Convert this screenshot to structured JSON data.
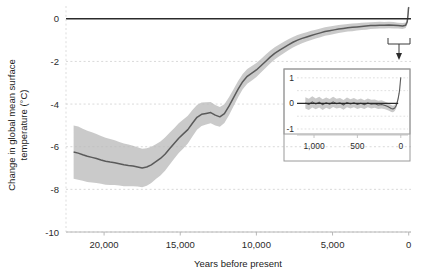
{
  "chart_data": {
    "type": "line",
    "title": "",
    "xlabel": "Years before present",
    "ylabel": "Change in global mean surface temperature (°C)",
    "xlim": [
      22500,
      -150
    ],
    "ylim": [
      -10,
      0.6
    ],
    "x_ticks": [
      20000,
      15000,
      10000,
      5000,
      0
    ],
    "x_tick_labels": [
      "20,000",
      "15,000",
      "10,000",
      "5,000",
      "0"
    ],
    "y_ticks": [
      0,
      -2,
      -4,
      -6,
      -8,
      -10
    ],
    "y_tick_labels": [
      "0",
      "-2",
      "-4",
      "-6",
      "-8",
      "-10"
    ],
    "grid": "horizontal-dashed",
    "legend": "none",
    "zero_reference_line": 0,
    "series": [
      {
        "name": "Global mean surface temperature anomaly",
        "color": "#5a5a5a",
        "band_color": "#b8b8b8",
        "x": [
          22000,
          21700,
          21400,
          21100,
          20800,
          20500,
          20200,
          19900,
          19600,
          19300,
          19000,
          18700,
          18400,
          18100,
          17800,
          17500,
          17200,
          16900,
          16600,
          16300,
          16000,
          15700,
          15400,
          15100,
          14800,
          14500,
          14200,
          13900,
          13600,
          13300,
          13000,
          12700,
          12400,
          12100,
          11800,
          11500,
          11200,
          10900,
          10600,
          10300,
          10000,
          9700,
          9400,
          9100,
          8800,
          8500,
          8200,
          7900,
          7600,
          7300,
          7000,
          6700,
          6400,
          6100,
          5800,
          5500,
          5200,
          4900,
          4600,
          4300,
          4000,
          3700,
          3400,
          3100,
          2800,
          2500,
          2200,
          1900,
          1600,
          1300,
          1000,
          700,
          400,
          200,
          100,
          50,
          20,
          0
        ],
        "y": [
          -6.25,
          -6.3,
          -6.38,
          -6.45,
          -6.5,
          -6.55,
          -6.62,
          -6.68,
          -6.72,
          -6.75,
          -6.8,
          -6.85,
          -6.88,
          -6.9,
          -6.95,
          -7.0,
          -6.95,
          -6.85,
          -6.7,
          -6.55,
          -6.35,
          -6.1,
          -5.85,
          -5.6,
          -5.4,
          -5.2,
          -4.9,
          -4.62,
          -4.48,
          -4.44,
          -4.4,
          -4.52,
          -4.6,
          -4.45,
          -4.1,
          -3.7,
          -3.3,
          -2.95,
          -2.7,
          -2.55,
          -2.4,
          -2.2,
          -2.0,
          -1.8,
          -1.62,
          -1.48,
          -1.35,
          -1.22,
          -1.1,
          -1.0,
          -0.92,
          -0.85,
          -0.78,
          -0.72,
          -0.66,
          -0.6,
          -0.56,
          -0.52,
          -0.48,
          -0.45,
          -0.42,
          -0.4,
          -0.38,
          -0.36,
          -0.34,
          -0.32,
          -0.31,
          -0.3,
          -0.3,
          -0.29,
          -0.3,
          -0.32,
          -0.34,
          -0.3,
          -0.15,
          0.15,
          0.45,
          0.55
        ],
        "band_half_width": [
          1.25,
          1.25,
          1.22,
          1.2,
          1.18,
          1.15,
          1.12,
          1.1,
          1.08,
          1.05,
          1.02,
          1.0,
          0.98,
          0.95,
          0.92,
          0.9,
          0.88,
          0.85,
          0.82,
          0.8,
          0.78,
          0.75,
          0.72,
          0.7,
          0.68,
          0.65,
          0.62,
          0.58,
          0.55,
          0.52,
          0.5,
          0.48,
          0.46,
          0.44,
          0.42,
          0.4,
          0.38,
          0.36,
          0.35,
          0.34,
          0.33,
          0.32,
          0.31,
          0.3,
          0.29,
          0.28,
          0.27,
          0.26,
          0.25,
          0.24,
          0.23,
          0.22,
          0.22,
          0.21,
          0.21,
          0.2,
          0.2,
          0.19,
          0.19,
          0.18,
          0.18,
          0.18,
          0.17,
          0.17,
          0.17,
          0.16,
          0.16,
          0.16,
          0.15,
          0.15,
          0.15,
          0.14,
          0.14,
          0.13,
          0.12,
          0.1,
          0.08,
          0.06
        ]
      }
    ],
    "annotations": [
      {
        "type": "bracket-to-inset",
        "description": "bracket under recent interval with arrow pointing to inset panel"
      }
    ],
    "inset": {
      "type": "line",
      "xlabel": "",
      "ylabel": "",
      "xlim": [
        1150,
        -60
      ],
      "ylim": [
        -1,
        1.15
      ],
      "x_ticks": [
        1000,
        500,
        0
      ],
      "x_tick_labels": [
        "1,000",
        "500",
        "0"
      ],
      "y_ticks": [
        1,
        0,
        -1
      ],
      "y_tick_labels": [
        "1",
        "0",
        "-1"
      ],
      "grid": "horizontal-dashed",
      "zero_reference_line": 0,
      "series": [
        {
          "name": "Last millennium temperature anomaly",
          "color": "#5a5a5a",
          "band_color": "#b8b8b8",
          "x": [
            1100,
            1060,
            1020,
            980,
            940,
            900,
            860,
            820,
            780,
            740,
            700,
            660,
            620,
            580,
            540,
            500,
            460,
            420,
            380,
            340,
            300,
            260,
            220,
            180,
            150,
            130,
            110,
            90,
            70,
            55,
            40,
            30,
            20,
            12,
            6,
            0
          ],
          "y": [
            0.02,
            -0.04,
            0.06,
            -0.02,
            0.05,
            -0.05,
            0.03,
            -0.03,
            0.06,
            -0.01,
            0.02,
            -0.06,
            0.04,
            -0.02,
            0.03,
            -0.04,
            0.01,
            -0.05,
            0.02,
            -0.03,
            -0.01,
            -0.06,
            -0.04,
            -0.08,
            -0.12,
            -0.16,
            -0.2,
            -0.22,
            -0.18,
            -0.1,
            0.05,
            0.2,
            0.38,
            0.58,
            0.82,
            1.02
          ],
          "band_half_width": [
            0.22,
            0.22,
            0.22,
            0.21,
            0.21,
            0.21,
            0.2,
            0.2,
            0.2,
            0.19,
            0.19,
            0.19,
            0.19,
            0.18,
            0.18,
            0.18,
            0.18,
            0.17,
            0.17,
            0.17,
            0.16,
            0.16,
            0.16,
            0.15,
            0.15,
            0.14,
            0.14,
            0.13,
            0.12,
            0.11,
            0.09,
            0.07,
            0.06,
            0.05,
            0.04,
            0.03
          ]
        }
      ]
    }
  }
}
